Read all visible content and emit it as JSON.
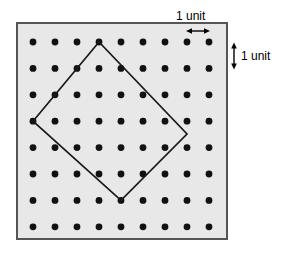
{
  "figure": {
    "board": {
      "x": 16,
      "y": 22,
      "width": 212,
      "height": 218,
      "fill": "#e8e8e8",
      "stroke": "#555555",
      "stroke_width": 2
    },
    "grid": {
      "columns": 9,
      "rows": 8,
      "origin_x": 33,
      "origin_y": 42,
      "spacing_x": 22,
      "spacing_y": 26.4,
      "dot_radius": 3.4,
      "dot_color": "#111111"
    },
    "shape": {
      "name": "tilted-square",
      "stroke": "#1a1a1a",
      "stroke_width": 1.6,
      "fill": "none",
      "vertices": [
        {
          "col": 0,
          "row": 3,
          "x": 33,
          "y": 121
        },
        {
          "col": 3,
          "row": 0,
          "x": 99,
          "y": 42
        },
        {
          "col": 7,
          "row": 3.5,
          "x": 187,
          "y": 134
        },
        {
          "col": 4,
          "row": 6,
          "x": 121,
          "y": 200
        }
      ]
    },
    "annotations": {
      "horizontal": {
        "label": "1 unit",
        "arrow": {
          "x1": 187,
          "x2": 209,
          "y": 31
        }
      },
      "vertical": {
        "label": "1 unit",
        "arrow": {
          "x": 234,
          "y1": 43,
          "y2": 69
        }
      }
    }
  }
}
